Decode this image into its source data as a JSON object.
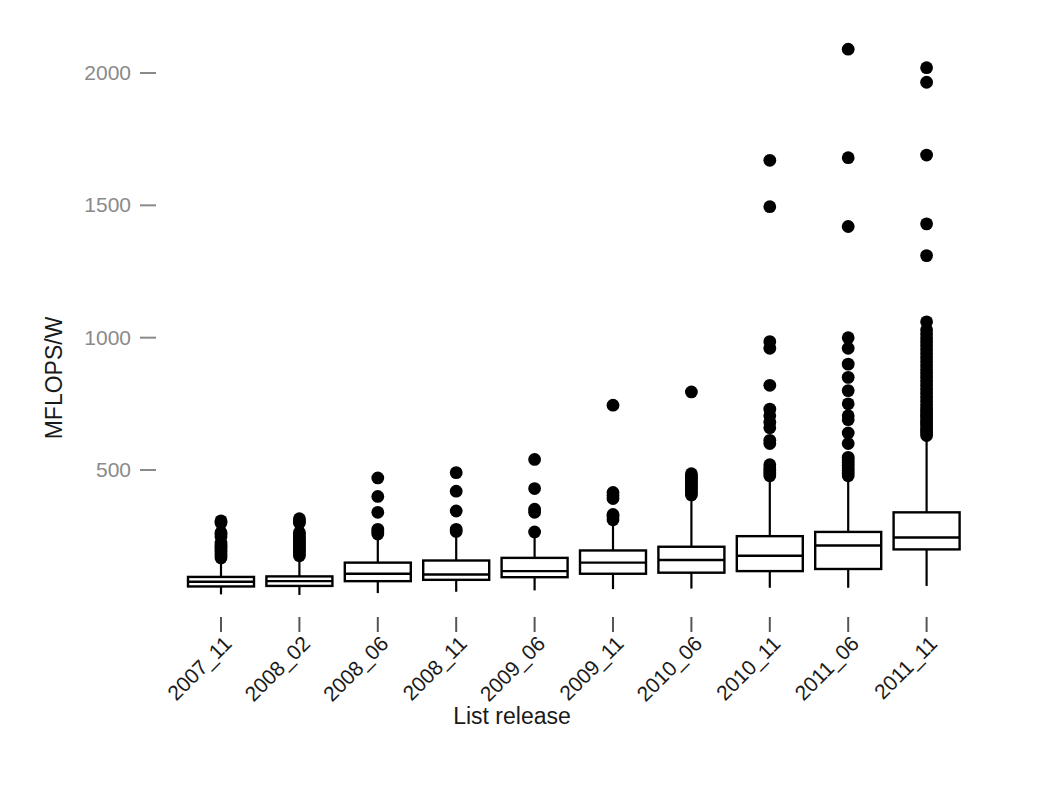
{
  "chart_data": {
    "type": "box",
    "title": "",
    "xlabel": "List release",
    "ylabel": "MFLOPS/W",
    "ylim": [
      0,
      2150
    ],
    "yticks": [
      500,
      1000,
      1500,
      2000
    ],
    "ytick_labels": [
      "500",
      "1000",
      "1500",
      "2000"
    ],
    "grid": false,
    "legend": null,
    "categories": [
      "2007_11",
      "2008_02",
      "2008_06",
      "2008_11",
      "2009_06",
      "2009_11",
      "2010_06",
      "2010_11",
      "2011_06",
      "2011_11"
    ],
    "boxes": [
      {
        "category": "2007_11",
        "lower_whisker": 30,
        "q1": 60,
        "median": 78,
        "q3": 96,
        "upper_whisker": 155,
        "outliers": [
          168,
          176,
          184,
          192,
          200,
          208,
          216,
          224,
          248,
          256,
          264,
          300,
          308
        ]
      },
      {
        "category": "2008_02",
        "lower_whisker": 28,
        "q1": 62,
        "median": 80,
        "q3": 98,
        "upper_whisker": 168,
        "outliers": [
          176,
          184,
          192,
          200,
          208,
          216,
          224,
          232,
          240,
          248,
          256,
          264,
          300,
          308,
          316
        ]
      },
      {
        "category": "2008_06",
        "lower_whisker": 35,
        "q1": 80,
        "median": 108,
        "q3": 150,
        "upper_whisker": 250,
        "outliers": [
          258,
          268,
          276,
          340,
          400,
          470
        ]
      },
      {
        "category": "2008_11",
        "lower_whisker": 40,
        "q1": 85,
        "median": 105,
        "q3": 158,
        "upper_whisker": 258,
        "outliers": [
          268,
          276,
          345,
          420,
          490
        ]
      },
      {
        "category": "2009_06",
        "lower_whisker": 45,
        "q1": 95,
        "median": 118,
        "q3": 168,
        "upper_whisker": 255,
        "outliers": [
          266,
          340,
          352,
          430,
          540
        ]
      },
      {
        "category": "2009_11",
        "lower_whisker": 50,
        "q1": 108,
        "median": 150,
        "q3": 196,
        "upper_whisker": 300,
        "outliers": [
          312,
          322,
          332,
          392,
          404,
          415,
          745
        ]
      },
      {
        "category": "2010_06",
        "lower_whisker": 52,
        "q1": 112,
        "median": 160,
        "q3": 210,
        "upper_whisker": 400,
        "outliers": [
          406,
          414,
          422,
          430,
          438,
          446,
          454,
          462,
          470,
          478,
          486,
          795
        ]
      },
      {
        "category": "2010_11",
        "lower_whisker": 55,
        "q1": 118,
        "median": 176,
        "q3": 250,
        "upper_whisker": 470,
        "outliers": [
          478,
          488,
          498,
          508,
          520,
          600,
          612,
          660,
          680,
          705,
          730,
          820,
          960,
          985,
          1495,
          1670
        ]
      },
      {
        "category": "2011_06",
        "lower_whisker": 55,
        "q1": 126,
        "median": 215,
        "q3": 266,
        "upper_whisker": 470,
        "outliers": [
          478,
          488,
          498,
          508,
          518,
          528,
          538,
          548,
          600,
          640,
          690,
          705,
          750,
          800,
          850,
          900,
          960,
          1000,
          1420,
          1680,
          2090
        ]
      },
      {
        "category": "2011_11",
        "lower_whisker": 62,
        "q1": 200,
        "median": 245,
        "q3": 340,
        "upper_whisker": 620,
        "outliers": [
          630,
          640,
          650,
          660,
          670,
          680,
          690,
          700,
          710,
          720,
          730,
          745,
          760,
          775,
          790,
          805,
          820,
          835,
          850,
          865,
          880,
          895,
          910,
          925,
          940,
          955,
          970,
          985,
          1000,
          1015,
          1030,
          1060,
          1310,
          1430,
          1690,
          1965,
          2020
        ]
      }
    ]
  }
}
